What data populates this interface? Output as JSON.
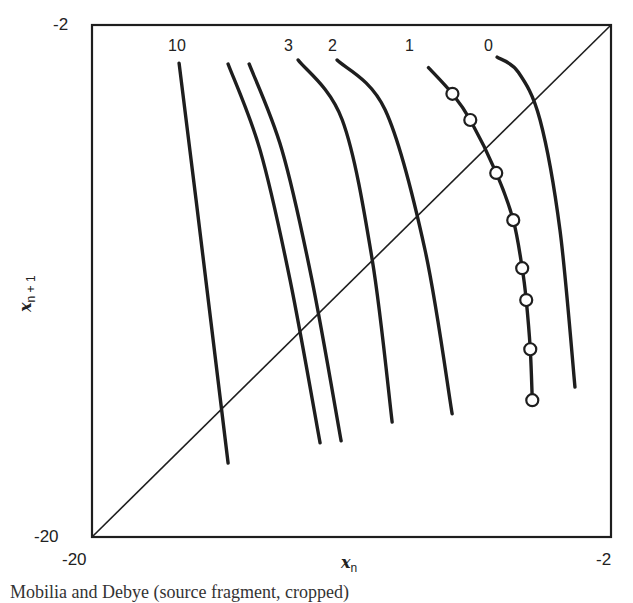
{
  "chart_data": {
    "type": "line",
    "title": "",
    "xlabel": "x_n",
    "ylabel": "x_{n+1}",
    "xlim": [
      -20,
      -2
    ],
    "ylim": [
      -20,
      -2
    ],
    "x_ticks": [
      "-20",
      "-2"
    ],
    "y_ticks": [
      "-20",
      "-2"
    ],
    "grid": false,
    "legend": "curve labels placed at top of each curve",
    "reference_line": {
      "name": "x_{n+1} = x_n",
      "x": [
        -20,
        -2
      ],
      "y": [
        -20,
        -2
      ]
    },
    "series": [
      {
        "name": "10",
        "labeled": true,
        "x": [
          -16.98,
          -16.39,
          -15.28
        ],
        "y": [
          -3.34,
          -8.15,
          -17.4
        ]
      },
      {
        "name": "unlabeled-a",
        "labeled": false,
        "x": [
          -15.28,
          -14.17,
          -13.13,
          -12.09
        ],
        "y": [
          -3.37,
          -6.4,
          -10.97,
          -16.69
        ]
      },
      {
        "name": "unlabeled-b",
        "labeled": false,
        "x": [
          -14.55,
          -13.41,
          -12.37,
          -11.36
        ],
        "y": [
          -3.37,
          -6.4,
          -10.97,
          -16.62
        ]
      },
      {
        "name": "3",
        "labeled": true,
        "x": [
          -12.85,
          -11.32,
          -10.28,
          -9.59
        ],
        "y": [
          -3.23,
          -5.34,
          -10.26,
          -15.96
        ]
      },
      {
        "name": "2",
        "labeled": true,
        "x": [
          -11.5,
          -9.83,
          -8.45,
          -7.51
        ],
        "y": [
          -3.23,
          -4.99,
          -9.91,
          -15.67
        ]
      },
      {
        "name": "1",
        "labeled": true,
        "markers": "open-circles",
        "x": [
          -8.33,
          -7.5,
          -6.88,
          -5.98,
          -5.39,
          -5.08,
          -4.94,
          -4.8,
          -4.73
        ],
        "y": [
          -3.5,
          -4.42,
          -5.34,
          -7.2,
          -8.86,
          -10.55,
          -11.67,
          -13.4,
          -15.19
        ]
      },
      {
        "name": "0",
        "labeled": true,
        "x": [
          -5.95,
          -5.22,
          -4.46,
          -3.77,
          -3.25
        ],
        "y": [
          -3.13,
          -3.65,
          -5.34,
          -9.21,
          -14.73
        ]
      }
    ],
    "curve_labels": [
      "10",
      "3",
      "2",
      "1",
      "0"
    ]
  },
  "axes": {
    "x_min_label": "-20",
    "x_max_label": "-2",
    "y_min_label": "-20",
    "y_max_label": "-2",
    "x_label_var": "x",
    "x_label_sub": "n",
    "y_label_var": "x",
    "y_label_sub": "n + 1"
  },
  "labels": {
    "c10": "10",
    "c3": "3",
    "c2": "2",
    "c1": "1",
    "c0": "0"
  },
  "caption": "Mobilia and Debye (source fragment, cropped)",
  "colors": {
    "line": "#1e1e1e",
    "background": "#ffffff"
  }
}
